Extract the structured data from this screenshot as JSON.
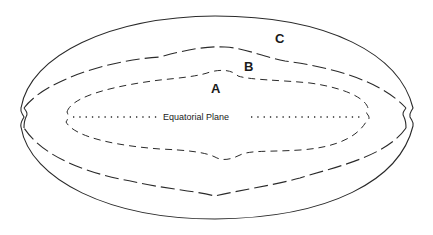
{
  "diagram": {
    "labels": {
      "a": "A",
      "b": "B",
      "c": "C"
    },
    "equatorial_plane": "Equatorial Plane",
    "curves": [
      {
        "id": "C",
        "style": "solid",
        "description": "outer boundary"
      },
      {
        "id": "B",
        "style": "long-dash",
        "description": "middle boundary"
      },
      {
        "id": "A",
        "style": "short-dash",
        "description": "inner boundary"
      }
    ],
    "colors": {
      "line": "#2a2a2a",
      "background": "#ffffff"
    }
  }
}
